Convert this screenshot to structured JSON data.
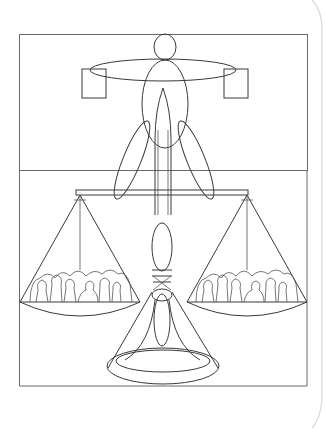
{
  "illustration": {
    "subject": "balance-scale-figure",
    "description": "Line drawing of a human figure merged with a balance scale; each pan holds a crowd of people",
    "colors": {
      "background": "#ffffff",
      "line": "#3a3a3a",
      "frame": "#6a6a6a",
      "page_curl": "#d8d8d8"
    },
    "elements": [
      "frame",
      "head",
      "arms",
      "hands-squares",
      "torso",
      "legs",
      "beam",
      "left-pan",
      "right-pan",
      "crowd-left",
      "crowd-right",
      "pillar",
      "base"
    ]
  }
}
